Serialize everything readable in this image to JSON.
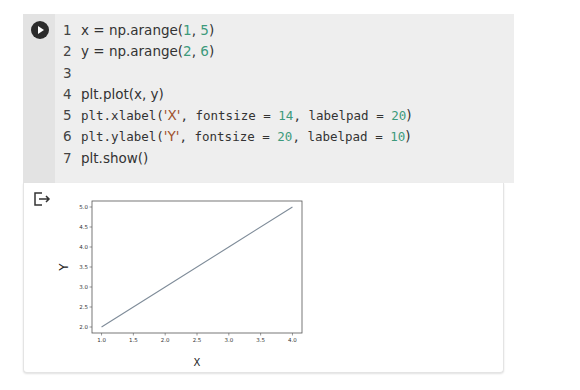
{
  "code_cell": {
    "lines": [
      {
        "n": "1",
        "parts": [
          {
            "t": "x = np.arange(",
            "k": "plain"
          },
          {
            "t": "1",
            "k": "num"
          },
          {
            "t": ", ",
            "k": "plain"
          },
          {
            "t": "5",
            "k": "num"
          },
          {
            "t": ")",
            "k": "plain"
          }
        ]
      },
      {
        "n": "2",
        "parts": [
          {
            "t": "y = np.arange(",
            "k": "plain"
          },
          {
            "t": "2",
            "k": "num"
          },
          {
            "t": ", ",
            "k": "plain"
          },
          {
            "t": "6",
            "k": "num"
          },
          {
            "t": ")",
            "k": "plain"
          }
        ]
      },
      {
        "n": "3",
        "parts": []
      },
      {
        "n": "4",
        "parts": [
          {
            "t": "plt.plot(x, y)",
            "k": "plain"
          }
        ]
      },
      {
        "n": "5",
        "parts": [
          {
            "t": "plt.xlabel(",
            "k": "plain"
          },
          {
            "t": "'X'",
            "k": "str"
          },
          {
            "t": ", fontsize = ",
            "k": "plain"
          },
          {
            "t": "14",
            "k": "num"
          },
          {
            "t": ", labelpad = ",
            "k": "plain"
          },
          {
            "t": "20",
            "k": "num"
          },
          {
            "t": ")",
            "k": "plain"
          }
        ]
      },
      {
        "n": "6",
        "parts": [
          {
            "t": "plt.ylabel(",
            "k": "plain"
          },
          {
            "t": "'Y'",
            "k": "str"
          },
          {
            "t": ", fontsize = ",
            "k": "plain"
          },
          {
            "t": "20",
            "k": "num"
          },
          {
            "t": ", labelpad = ",
            "k": "plain"
          },
          {
            "t": "10",
            "k": "num"
          },
          {
            "t": ")",
            "k": "plain"
          }
        ]
      },
      {
        "n": "7",
        "parts": [
          {
            "t": "plt.show()",
            "k": "plain"
          }
        ]
      }
    ],
    "run_icon": "play-circle-icon"
  },
  "output_cell": {
    "icon": "output-arrow-icon"
  },
  "chart_data": {
    "type": "line",
    "x": [
      1,
      2,
      3,
      4
    ],
    "series": [
      {
        "name": "y",
        "values": [
          2,
          3,
          4,
          5
        ],
        "color": "#7f8c99"
      }
    ],
    "title": "",
    "xlabel": "X",
    "ylabel": "Y",
    "xlim": [
      0.85,
      4.15
    ],
    "ylim": [
      1.85,
      5.15
    ],
    "xticks": [
      "1.0",
      "1.5",
      "2.0",
      "2.5",
      "3.0",
      "3.5",
      "4.0"
    ],
    "yticks": [
      "2.0",
      "2.5",
      "3.0",
      "3.5",
      "4.0",
      "4.5",
      "5.0"
    ],
    "grid": false
  }
}
